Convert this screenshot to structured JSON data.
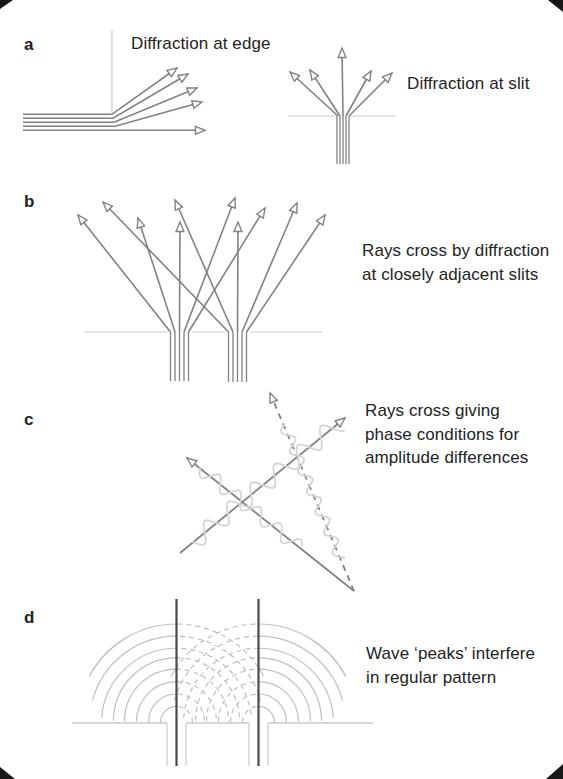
{
  "figure": {
    "type": "physics-diffraction-illustration",
    "panels": {
      "a": {
        "label": "a",
        "caption_edge": "Diffraction at edge",
        "caption_slit": "Diffraction at slit"
      },
      "b": {
        "label": "b",
        "caption_line1": "Rays cross by diffraction",
        "caption_line2": "at closely adjacent slits"
      },
      "c": {
        "label": "c",
        "caption_line1": "Rays cross giving",
        "caption_line2": "phase conditions for",
        "caption_line3": "amplitude differences"
      },
      "d": {
        "label": "d",
        "caption_line1": "Wave ‘peaks’ interfere",
        "caption_line2": "in regular pattern"
      }
    }
  },
  "colors": {
    "background": "#ffffff",
    "text": "#232323",
    "ray": "#828282",
    "light_line": "#c9c9c9",
    "wave": "#d5d5d5",
    "arc": "#bfbfbf",
    "dark_line": "#4a4a4a",
    "arrow_fill": "#ffffff",
    "artifact": "#171717"
  }
}
